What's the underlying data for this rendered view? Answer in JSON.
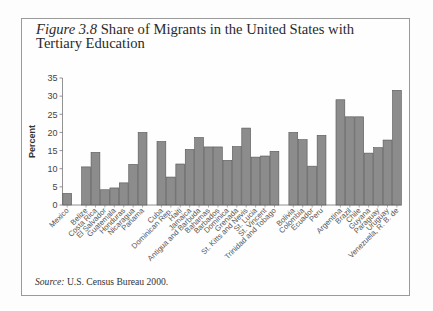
{
  "figure": {
    "label": "Figure 3.8",
    "title": "Share of Migrants in the United States with Tertiary Education",
    "source_label": "Source:",
    "source_text": "U.S. Census Bureau 2000."
  },
  "chart_data": {
    "type": "bar",
    "title": "Share of Migrants in the United States with Tertiary Education",
    "xlabel": "",
    "ylabel": "Percent",
    "ylim": [
      0,
      35
    ],
    "yticks": [
      0,
      5,
      10,
      15,
      20,
      25,
      30,
      35
    ],
    "grid": false,
    "legend": null,
    "bar_color": "#8c8c8c",
    "groups": [
      {
        "name": "Mexico",
        "categories": [
          "Mexico"
        ],
        "values": [
          3.2
        ]
      },
      {
        "name": "Central America",
        "categories": [
          "Belize",
          "Costa Rica",
          "El Salvador",
          "Guatemala",
          "Honduras",
          "Nicaragua",
          "Panama"
        ],
        "values": [
          10.5,
          14.5,
          4.2,
          4.7,
          6.1,
          11.2,
          20.0
        ]
      },
      {
        "name": "Caribbean",
        "categories": [
          "Cuba",
          "Dominican Rep.",
          "Haiti",
          "Jamaica",
          "Antigua and Barbuda",
          "Bahamas",
          "Barbados",
          "Dominica",
          "Grenada",
          "St. Kitts and Nevis",
          "St. Lucia",
          "St. Vincent",
          "Trinidad and Tobago"
        ],
        "values": [
          17.5,
          7.7,
          11.3,
          15.3,
          18.6,
          16.0,
          16.0,
          12.3,
          16.1,
          21.2,
          13.2,
          13.5,
          14.8
        ]
      },
      {
        "name": "Andean",
        "categories": [
          "Bolivia",
          "Colombia",
          "Ecuador",
          "Peru"
        ],
        "values": [
          20.0,
          18.0,
          10.7,
          19.2
        ]
      },
      {
        "name": "Southern Cone and others",
        "categories": [
          "Argentina",
          "Brazil",
          "Chile",
          "Guyana",
          "Paraguay",
          "Uruguay",
          "Venezuela, R. B. de"
        ],
        "values": [
          29.0,
          24.3,
          24.3,
          14.3,
          15.8,
          17.9,
          31.6
        ]
      }
    ]
  }
}
